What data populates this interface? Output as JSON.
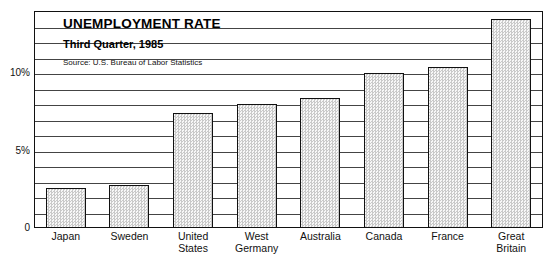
{
  "chart_data": {
    "type": "bar",
    "title": "UNEMPLOYMENT RATE",
    "subtitle": "Third Quarter, 1985",
    "source": "Source: U.S. Bureau of Labor Statistics",
    "xlabel": "",
    "ylabel": "",
    "ylim": [
      0,
      14
    ],
    "grid": true,
    "grid_interval": 1,
    "legend": "none",
    "categories": [
      "Japan",
      "Sweden",
      "United\nStates",
      "West\nGermany",
      "Australia",
      "Canada",
      "France",
      "Great\nBritain"
    ],
    "values": [
      2.6,
      2.8,
      7.4,
      8.0,
      8.4,
      10.0,
      10.4,
      13.5
    ],
    "ticks": [
      {
        "value": 0,
        "label": "0"
      },
      {
        "value": 5,
        "label": "5%"
      },
      {
        "value": 10,
        "label": "10%"
      }
    ]
  },
  "colors": {
    "bar_fill_light": "#f7f7f7",
    "bar_fill_dot": "#c9c9c9",
    "bar_outline": "#111111",
    "gridline": "#444444",
    "frame": "#111111",
    "text": "#000000"
  }
}
